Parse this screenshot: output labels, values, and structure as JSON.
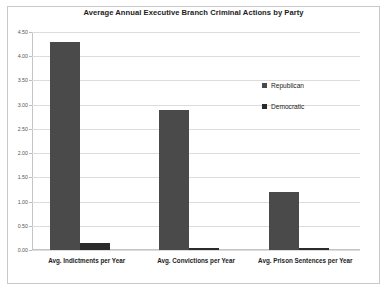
{
  "chart_data": {
    "type": "bar",
    "title": "Average Annual Executive Branch Criminal Actions by Party",
    "xlabel": "",
    "ylabel": "",
    "ylim": [
      0,
      4.5
    ],
    "grid": true,
    "legend_position": "right-inside",
    "categories": [
      "Avg. Indictments per Year",
      "Avg. Convictions per Year",
      "Avg. Prison Sentences per Year"
    ],
    "ytick_labels": [
      "0.00",
      "0.50",
      "1.00",
      "1.50",
      "2.00",
      "2.50",
      "3.00",
      "3.50",
      "4.00",
      "4.50"
    ],
    "ytick_values": [
      0,
      0.5,
      1,
      1.5,
      2,
      2.5,
      3,
      3.5,
      4,
      4.5
    ],
    "series": [
      {
        "name": "Republican",
        "color": "#4a4a4a",
        "values": [
          4.3,
          2.9,
          1.2
        ]
      },
      {
        "name": "Democratic",
        "color": "#2b2b2b",
        "values": [
          0.15,
          0.04,
          0.04
        ]
      }
    ]
  }
}
